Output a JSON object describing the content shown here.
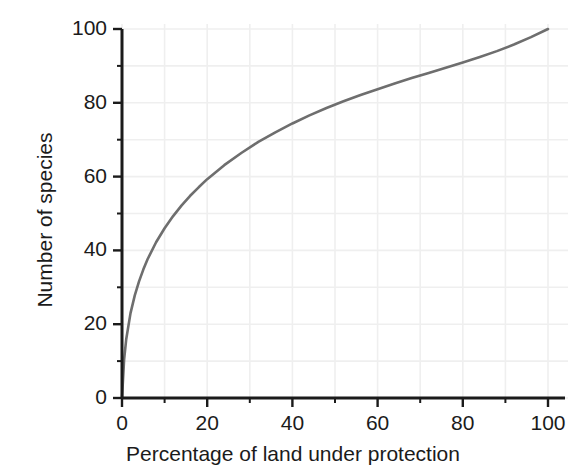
{
  "chart_data": {
    "type": "line",
    "title": "",
    "subtitle": "",
    "xlabel": "Percentage of land under protection",
    "ylabel": "Number of species",
    "xlim": [
      0,
      100
    ],
    "ylim": [
      0,
      100
    ],
    "xticks": [
      0,
      20,
      40,
      60,
      80,
      100
    ],
    "xtick_labels": [
      "0",
      "20",
      "40",
      "60",
      "80",
      "100"
    ],
    "yticks": [
      0,
      20,
      40,
      60,
      80,
      100
    ],
    "ytick_labels": [
      "0",
      "20",
      "40",
      "60",
      "80",
      "100"
    ],
    "x_minor_tick_interval": 10,
    "y_minor_tick_interval": 10,
    "grid": true,
    "grid_interval": 10,
    "grid_color": "#efefef",
    "legend": null,
    "legend_position": "none",
    "annotations": [],
    "series": [
      {
        "name": "species accumulation",
        "color": "#6e6e6e",
        "line_width": 2.6,
        "x": [
          0,
          0.5,
          1,
          2,
          3,
          4,
          5,
          6,
          8,
          10,
          12,
          14,
          16,
          18,
          20,
          24,
          28,
          32,
          36,
          40,
          44,
          48,
          52,
          56,
          60,
          64,
          68,
          72,
          76,
          80,
          84,
          88,
          92,
          96,
          100
        ],
        "y": [
          0,
          10.5,
          16.0,
          23.0,
          27.8,
          31.6,
          34.8,
          37.6,
          42.2,
          46.0,
          49.3,
          52.2,
          54.8,
          57.1,
          59.3,
          63.1,
          66.4,
          69.4,
          72.0,
          74.4,
          76.6,
          78.6,
          80.4,
          82.1,
          83.7,
          85.2,
          86.7,
          88.1,
          89.5,
          90.9,
          92.4,
          94.0,
          95.8,
          97.8,
          100.0
        ]
      }
    ]
  },
  "axes": {
    "axis_color": "#1b1b1b",
    "text_color": "#1b1b1b"
  }
}
